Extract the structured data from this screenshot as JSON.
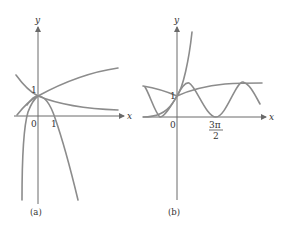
{
  "panels": [
    {
      "caption": "(a)",
      "x_axis_label": "x",
      "y_axis_label": "y",
      "origin_label": "0",
      "y_tick_label": "1",
      "x_tick_label": "1"
    },
    {
      "caption": "(b)",
      "x_axis_label": "x",
      "y_axis_label": "y",
      "origin_label": "0",
      "y_tick_label": "1",
      "x_tick_num": "3π",
      "x_tick_den": "2"
    }
  ],
  "colors": {
    "axis": "#6a6a6a",
    "curve": "#8c8c8c",
    "text": "#333333"
  }
}
